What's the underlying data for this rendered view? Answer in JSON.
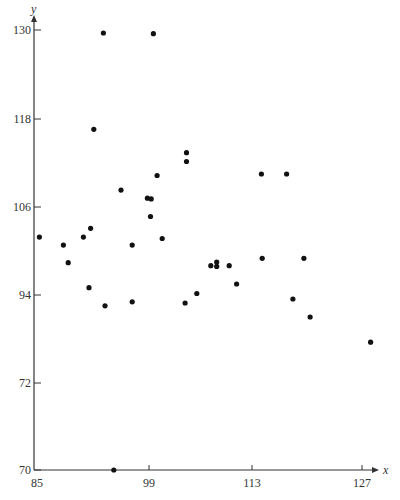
{
  "chart_data": {
    "type": "scatter",
    "title": "",
    "xlabel": "x",
    "ylabel": "y",
    "x_ticks": [
      85,
      99,
      113,
      127
    ],
    "y_ticks": [
      70,
      72,
      94,
      106,
      118,
      130
    ],
    "xlim": [
      85,
      129
    ],
    "ylim": [
      70,
      130
    ],
    "grid": false,
    "legend": null,
    "note": "Y-axis tick labels are evenly spaced on the page despite unequal numeric gaps; point y-values are interpolated within each labeled interval.",
    "points": [
      {
        "x": 85.3,
        "y": 101.9
      },
      {
        "x": 88.3,
        "y": 100.8
      },
      {
        "x": 88.9,
        "y": 98.4
      },
      {
        "x": 90.8,
        "y": 101.9
      },
      {
        "x": 91.7,
        "y": 103.1
      },
      {
        "x": 91.5,
        "y": 95.0
      },
      {
        "x": 93.3,
        "y": 129.6
      },
      {
        "x": 92.1,
        "y": 116.6
      },
      {
        "x": 93.5,
        "y": 91.3
      },
      {
        "x": 94.6,
        "y": 70.0
      },
      {
        "x": 95.5,
        "y": 108.3
      },
      {
        "x": 96.9,
        "y": 100.8
      },
      {
        "x": 96.9,
        "y": 92.3
      },
      {
        "x": 98.8,
        "y": 107.2
      },
      {
        "x": 99.3,
        "y": 107.1
      },
      {
        "x": 99.2,
        "y": 104.7
      },
      {
        "x": 99.6,
        "y": 129.5
      },
      {
        "x": 100.1,
        "y": 110.3
      },
      {
        "x": 100.8,
        "y": 101.7
      },
      {
        "x": 103.9,
        "y": 92.0
      },
      {
        "x": 104.1,
        "y": 113.4
      },
      {
        "x": 104.1,
        "y": 112.2
      },
      {
        "x": 105.5,
        "y": 94.2
      },
      {
        "x": 107.4,
        "y": 98.0
      },
      {
        "x": 108.2,
        "y": 98.5
      },
      {
        "x": 108.2,
        "y": 97.9
      },
      {
        "x": 109.9,
        "y": 98.0
      },
      {
        "x": 110.9,
        "y": 95.5
      },
      {
        "x": 114.2,
        "y": 110.5
      },
      {
        "x": 114.3,
        "y": 99.0
      },
      {
        "x": 117.4,
        "y": 110.5
      },
      {
        "x": 118.2,
        "y": 93.0
      },
      {
        "x": 119.6,
        "y": 99.0
      },
      {
        "x": 120.4,
        "y": 88.5
      },
      {
        "x": 128.1,
        "y": 82.2
      }
    ]
  },
  "axes": {
    "x_label": "x",
    "y_label": "y",
    "x_tick_labels": [
      "85",
      "99",
      "113",
      "127"
    ],
    "y_tick_labels": [
      "130",
      "118",
      "106",
      "94",
      "72",
      "70"
    ]
  }
}
